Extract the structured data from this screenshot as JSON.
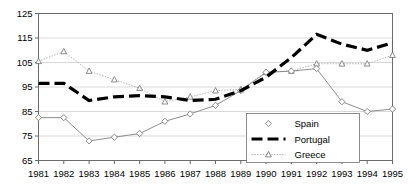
{
  "chart_data": {
    "type": "line",
    "title": "",
    "xlabel": "",
    "ylabel": "",
    "x": [
      1981,
      1982,
      1983,
      1984,
      1985,
      1986,
      1987,
      1988,
      1989,
      1990,
      1991,
      1992,
      1993,
      1994,
      1995
    ],
    "categories": [
      "1981",
      "1982",
      "1983",
      "1984",
      "1985",
      "1986",
      "1987",
      "1988",
      "1989",
      "1990",
      "1991",
      "1992",
      "1993",
      "1994",
      "1995"
    ],
    "series": [
      {
        "name": "Spain",
        "marker": "diamond",
        "line_style": "solid",
        "color": "#808080",
        "values": [
          82.5,
          82.5,
          73,
          74.5,
          76,
          81,
          84,
          87.5,
          93.5,
          101,
          101.5,
          102.5,
          89,
          85,
          86
        ]
      },
      {
        "name": "Portugal",
        "marker": "none",
        "line_style": "dashed",
        "color": "#000000",
        "values": [
          96.5,
          96.5,
          89.5,
          91,
          91.5,
          91,
          89.5,
          90,
          93.5,
          99,
          107,
          116.5,
          112.5,
          110,
          113
        ]
      },
      {
        "name": "Greece",
        "marker": "triangle",
        "line_style": "dotted",
        "color": "#a0a0a0",
        "values": [
          105.5,
          109.5,
          101.5,
          98,
          94.5,
          89,
          91,
          93.5,
          94,
          101,
          101.5,
          104.5,
          104.5,
          104.5,
          108
        ]
      }
    ],
    "ylim": [
      65,
      125
    ],
    "yticks": [
      65,
      75,
      85,
      95,
      105,
      115,
      125
    ],
    "ytick_labels": [
      "65",
      "75",
      "85",
      "95",
      "105",
      "115",
      "125"
    ],
    "xlim": [
      1981,
      1995
    ],
    "grid": "horizontal",
    "legend_position": "bottom-right",
    "legend_entries": [
      "Spain",
      "Portugal",
      "Greece"
    ]
  },
  "legend": {
    "items": [
      {
        "label": "Spain"
      },
      {
        "label": "Portugal"
      },
      {
        "label": "Greece"
      }
    ]
  }
}
